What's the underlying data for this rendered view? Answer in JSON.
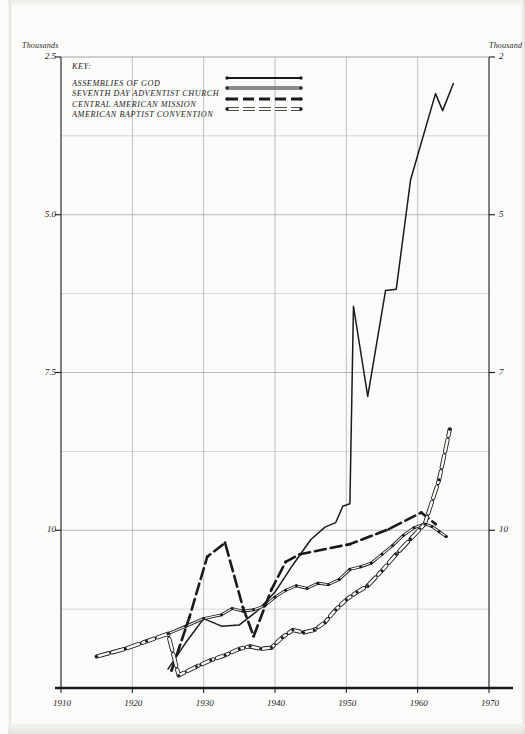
{
  "chart_data": {
    "type": "line",
    "title": "",
    "xlabel": "",
    "ylabel": "Thousands",
    "y_axis_caption_left": "Thousands",
    "y_axis_caption_right": "Thousands",
    "xlim": [
      1910,
      1970
    ],
    "ylim": [
      0,
      10
    ],
    "xticks": [
      "1910",
      "1920",
      "1930",
      "1940",
      "1950",
      "1960",
      "1970"
    ],
    "xtick_values": [
      1910,
      1920,
      1930,
      1940,
      1950,
      1960,
      1970
    ],
    "yticks": [
      "2.5",
      "5.0",
      "7.5",
      "10"
    ],
    "ytick_values": [
      2.5,
      5.0,
      7.5,
      10
    ],
    "yticks_right": [
      "2",
      "5",
      "7",
      "10"
    ],
    "grid": true,
    "grid_minor_y": [
      1.25,
      3.75,
      6.25,
      8.75
    ],
    "legend_position": "top-left",
    "legend_title": "KEY:",
    "series": [
      {
        "name": "ASSEMBLIES OF GOD",
        "style": "solid-thick",
        "marker": "none",
        "points": [
          [
            1925.0,
            0.3
          ],
          [
            1927.5,
            0.72
          ],
          [
            1930.0,
            1.1
          ],
          [
            1932.5,
            0.98
          ],
          [
            1935.0,
            1.0
          ],
          [
            1937.5,
            1.22
          ],
          [
            1940.0,
            1.52
          ],
          [
            1942.5,
            1.95
          ],
          [
            1945.0,
            2.35
          ],
          [
            1947.0,
            2.55
          ],
          [
            1948.5,
            2.62
          ],
          [
            1949.5,
            2.88
          ],
          [
            1950.5,
            2.92
          ],
          [
            1951.0,
            6.05
          ],
          [
            1953.0,
            4.62
          ],
          [
            1955.5,
            6.3
          ],
          [
            1957.0,
            6.32
          ],
          [
            1959.0,
            8.05
          ],
          [
            1962.5,
            9.42
          ],
          [
            1963.5,
            9.15
          ],
          [
            1965.0,
            9.58
          ]
        ]
      },
      {
        "name": "SEVENTH DAY ADVENTIST CHURCH",
        "style": "solid-thin-dotted",
        "marker": "dot",
        "points": [
          [
            1915.0,
            0.5
          ],
          [
            1917.5,
            0.58
          ],
          [
            1920.0,
            0.66
          ],
          [
            1922.5,
            0.76
          ],
          [
            1925.0,
            0.86
          ],
          [
            1927.5,
            0.98
          ],
          [
            1930.0,
            1.1
          ],
          [
            1932.5,
            1.16
          ],
          [
            1934.0,
            1.26
          ],
          [
            1935.5,
            1.22
          ],
          [
            1937.0,
            1.24
          ],
          [
            1938.5,
            1.3
          ],
          [
            1940.0,
            1.44
          ],
          [
            1941.5,
            1.55
          ],
          [
            1943.0,
            1.62
          ],
          [
            1944.5,
            1.58
          ],
          [
            1946.0,
            1.66
          ],
          [
            1947.5,
            1.64
          ],
          [
            1949.0,
            1.72
          ],
          [
            1950.5,
            1.88
          ],
          [
            1952.0,
            1.92
          ],
          [
            1953.5,
            1.98
          ],
          [
            1955.0,
            2.12
          ],
          [
            1956.5,
            2.26
          ],
          [
            1958.0,
            2.42
          ],
          [
            1959.5,
            2.54
          ],
          [
            1961.0,
            2.6
          ],
          [
            1962.0,
            2.56
          ],
          [
            1963.0,
            2.48
          ],
          [
            1964.0,
            2.4
          ]
        ]
      },
      {
        "name": "CENTRAL AMERICAN MISSION",
        "style": "dashed-thick",
        "marker": "dot",
        "points": [
          [
            1925.5,
            0.28
          ],
          [
            1928.0,
            1.12
          ],
          [
            1930.5,
            2.08
          ],
          [
            1933.0,
            2.3
          ],
          [
            1935.5,
            1.28
          ],
          [
            1937.0,
            0.82
          ],
          [
            1939.5,
            1.56
          ],
          [
            1941.5,
            2.0
          ],
          [
            1943.5,
            2.12
          ],
          [
            1950.5,
            2.28
          ],
          [
            1956.0,
            2.52
          ],
          [
            1960.5,
            2.78
          ],
          [
            1962.5,
            2.6
          ]
        ]
      },
      {
        "name": "AMERICAN BAPTIST CONVENTION",
        "style": "dashdot-thick",
        "marker": "dot",
        "points": [
          [
            1915.0,
            0.5
          ],
          [
            1919.0,
            0.62
          ],
          [
            1922.0,
            0.74
          ],
          [
            1925.0,
            0.86
          ],
          [
            1926.5,
            0.2
          ],
          [
            1929.0,
            0.34
          ],
          [
            1931.0,
            0.44
          ],
          [
            1933.0,
            0.52
          ],
          [
            1935.0,
            0.62
          ],
          [
            1936.5,
            0.66
          ],
          [
            1938.0,
            0.62
          ],
          [
            1939.5,
            0.64
          ],
          [
            1941.0,
            0.8
          ],
          [
            1942.5,
            0.92
          ],
          [
            1944.0,
            0.88
          ],
          [
            1945.5,
            0.92
          ],
          [
            1947.0,
            1.04
          ],
          [
            1948.5,
            1.24
          ],
          [
            1950.0,
            1.4
          ],
          [
            1951.5,
            1.52
          ],
          [
            1953.0,
            1.62
          ],
          [
            1955.0,
            1.86
          ],
          [
            1957.0,
            2.12
          ],
          [
            1959.0,
            2.36
          ],
          [
            1961.0,
            2.6
          ],
          [
            1963.0,
            3.3
          ],
          [
            1964.5,
            4.1
          ]
        ]
      }
    ]
  },
  "legend": {
    "title": "KEY:",
    "items": [
      {
        "label": "ASSEMBLIES OF GOD",
        "style": "solid-thick"
      },
      {
        "label": "SEVENTH DAY ADVENTIST CHURCH",
        "style": "solid-thin-dotted"
      },
      {
        "label": "CENTRAL AMERICAN MISSION",
        "style": "dashed-thick"
      },
      {
        "label": "AMERICAN BAPTIST CONVENTION",
        "style": "dashdot-thick"
      }
    ]
  },
  "axes": {
    "left_caption": "Thousands",
    "right_caption": "Thousand",
    "left_ticks": [
      "10",
      "7.5",
      "5.0",
      "2.5"
    ],
    "right_ticks": [
      "10",
      "7",
      "5",
      "2"
    ],
    "x_ticks": [
      "1910",
      "1920",
      "1930",
      "1940",
      "1950",
      "1960",
      "1970"
    ]
  },
  "colors": {
    "ink": "#1a1a1a",
    "grid": "#9a9a9a",
    "paper": "#fbfbf9"
  }
}
